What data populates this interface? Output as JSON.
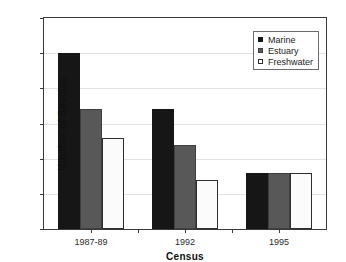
{
  "chart_data": {
    "type": "bar",
    "title": "",
    "xlabel": "Census",
    "ylabel": "Number of Species",
    "categories": [
      "1987-89",
      "1992",
      "1995"
    ],
    "series": [
      {
        "name": "Marine",
        "color": "#161616",
        "values": [
          25,
          17,
          8
        ]
      },
      {
        "name": "Estuary",
        "color": "#585858",
        "values": [
          17,
          12,
          8
        ]
      },
      {
        "name": "Freshwater",
        "color": "#ffffff",
        "values": [
          13,
          7,
          8
        ]
      }
    ],
    "ylim": [
      0,
      30
    ],
    "yticks": [
      0,
      5,
      10,
      15,
      20,
      25,
      30
    ],
    "ytick_labels": [
      "0",
      "5",
      "10",
      "15",
      "20",
      "25",
      "30"
    ],
    "grid": true,
    "legend_position": "top-right"
  },
  "axes": {
    "y": {
      "label": "Number of Species",
      "ticks": [
        "0",
        "5",
        "10",
        "15",
        "20",
        "25",
        "30"
      ]
    },
    "x": {
      "label": "Census",
      "ticks": [
        "1987-89",
        "1992",
        "1995"
      ]
    }
  },
  "legend": {
    "entries": [
      {
        "label": "Marine",
        "swatch": "filled-black-square"
      },
      {
        "label": "Estuary",
        "swatch": "filled-gray-square"
      },
      {
        "label": "Freshwater",
        "swatch": "open-white-square"
      }
    ]
  }
}
